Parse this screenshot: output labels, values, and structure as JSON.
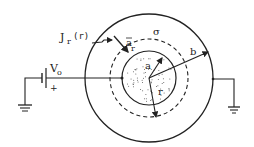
{
  "diagram": {
    "labels": {
      "current_density": "J",
      "current_density_sub": "r",
      "current_density_arg": "(r)",
      "unit_vector": "a",
      "unit_vector_sub": "r",
      "conductivity": "σ",
      "inner_radius": "a",
      "outer_radius": "b",
      "radius_var": "r",
      "voltage": "V",
      "voltage_sub": "o",
      "polarity": "+"
    },
    "colors": {
      "stroke": "#222222",
      "background": "#ffffff",
      "dots": "#555555"
    }
  }
}
